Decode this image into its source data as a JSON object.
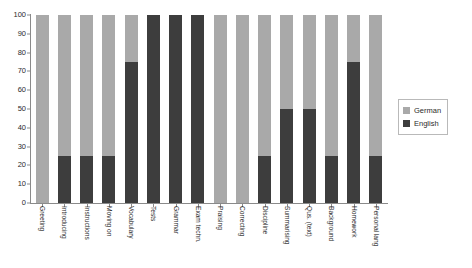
{
  "chart_data": {
    "type": "bar",
    "stacked": true,
    "stack_total": 100,
    "title": "",
    "subtitle": "",
    "xlabel": "",
    "ylabel": "",
    "ylim": [
      0,
      100
    ],
    "yticks": [
      100,
      90,
      80,
      70,
      60,
      50,
      40,
      30,
      20,
      10,
      0
    ],
    "grid": false,
    "legend_position": "right",
    "categories": [
      "Greeting",
      "Introducing",
      "Instructions",
      "Moving on",
      "Vocabulary",
      "Tests",
      "Grammar",
      "Exam techn.",
      "Praising",
      "Correcting",
      "Discipline",
      "Summarising",
      "Qus. (text)",
      "Background",
      "Homework",
      "Personal lang"
    ],
    "series": [
      {
        "name": "German",
        "color": "#a9a9a9",
        "values": [
          100,
          75,
          75,
          75,
          25,
          0,
          0,
          0,
          100,
          100,
          75,
          50,
          50,
          75,
          25,
          75
        ]
      },
      {
        "name": "English",
        "color": "#3d3d3d",
        "values": [
          0,
          25,
          25,
          25,
          75,
          100,
          100,
          100,
          0,
          0,
          25,
          50,
          50,
          25,
          75,
          25
        ]
      }
    ]
  },
  "legend": {
    "items": [
      {
        "label": "German",
        "color": "#a9a9a9"
      },
      {
        "label": "English",
        "color": "#3d3d3d"
      }
    ]
  }
}
